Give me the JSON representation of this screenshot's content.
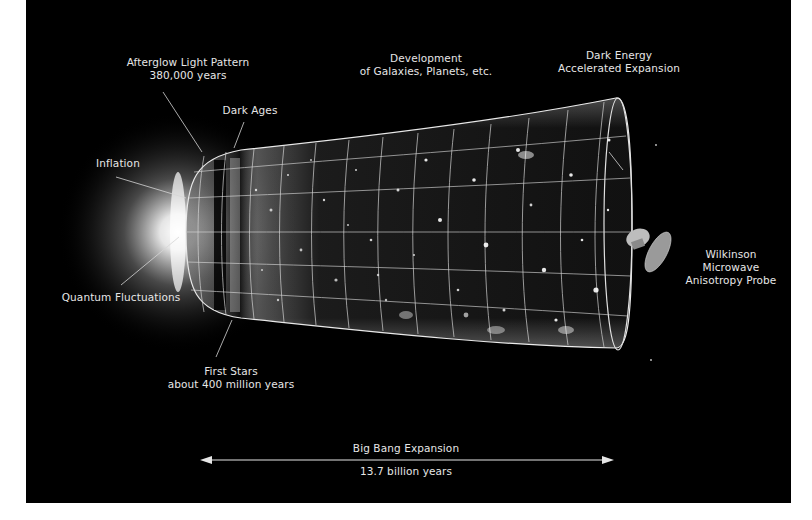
{
  "diagram": {
    "background_color": "#000000",
    "page_color": "#ffffff",
    "text_color": "#e6e6e6",
    "labels": {
      "afterglow": [
        "Afterglow Light Pattern",
        "380,000 years"
      ],
      "dark_ages": [
        "Dark Ages"
      ],
      "development": [
        "Development",
        "of Galaxies, Planets, etc."
      ],
      "dark_energy": [
        "Dark Energy",
        "Accelerated Expansion"
      ],
      "inflation": [
        "Inflation"
      ],
      "quantum": [
        "Quantum Fluctuations"
      ],
      "first_stars": [
        "First Stars",
        "about 400 million years"
      ],
      "wmap": [
        "Wilkinson",
        "Microwave",
        "Anisotropy Probe"
      ]
    },
    "timeline": {
      "title": "Big Bang Expansion",
      "duration": "13.7 billion years"
    }
  }
}
